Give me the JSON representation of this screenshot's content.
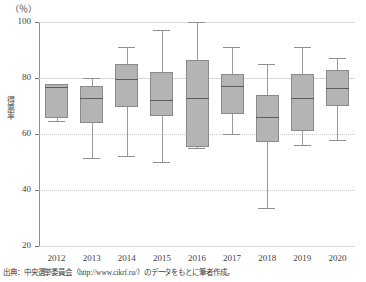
{
  "chart_data": {
    "type": "box",
    "title": "",
    "subtitle": "",
    "unit_label": "（％）",
    "ylabel": "得票率",
    "xlabel": "",
    "ylim": [
      20,
      100
    ],
    "yticks": [
      100,
      80,
      60,
      40,
      20
    ],
    "grid": true,
    "legend": null,
    "categories": [
      "2012",
      "2013",
      "2014",
      "2015",
      "2016",
      "2017",
      "2018",
      "2019",
      "2020"
    ],
    "boxes": [
      {
        "category": "2012",
        "whisker_low": 64.5,
        "q1": 65.7,
        "median": 76.8,
        "q3": 77.8,
        "whisker_high": 78.0
      },
      {
        "category": "2013",
        "whisker_low": 51.5,
        "q1": 64.0,
        "median": 73.0,
        "q3": 77.0,
        "whisker_high": 80.0
      },
      {
        "category": "2014",
        "whisker_low": 52.0,
        "q1": 69.5,
        "median": 79.5,
        "q3": 85.0,
        "whisker_high": 91.0
      },
      {
        "category": "2015",
        "whisker_low": 50.0,
        "q1": 66.5,
        "median": 72.0,
        "q3": 82.0,
        "whisker_high": 97.0
      },
      {
        "category": "2016",
        "whisker_low": 55.0,
        "q1": 55.5,
        "median": 73.0,
        "q3": 86.5,
        "whisker_high": 100.0
      },
      {
        "category": "2017",
        "whisker_low": 60.0,
        "q1": 67.0,
        "median": 77.0,
        "q3": 81.5,
        "whisker_high": 91.0
      },
      {
        "category": "2018",
        "whisker_low": 33.5,
        "q1": 57.0,
        "median": 66.0,
        "q3": 74.0,
        "whisker_high": 85.0
      },
      {
        "category": "2019",
        "whisker_low": 56.0,
        "q1": 61.0,
        "median": 73.0,
        "q3": 81.5,
        "whisker_high": 91.0
      },
      {
        "category": "2020",
        "whisker_low": 58.0,
        "q1": 70.0,
        "median": 76.5,
        "q3": 83.0,
        "whisker_high": 87.0
      }
    ],
    "colors": {
      "box_fill": "#b4b4b4",
      "box_border": "#8a8a8a",
      "median": "#5d5d5d",
      "whisker": "#9a9a9a",
      "grid": "#d8d8d8",
      "axis": "#8c8c8c",
      "text": "#3b3b3b"
    }
  },
  "source_note": "出典：中央選挙委員会（http://www.cikrf.ru/）のデータをもとに筆者作成。"
}
